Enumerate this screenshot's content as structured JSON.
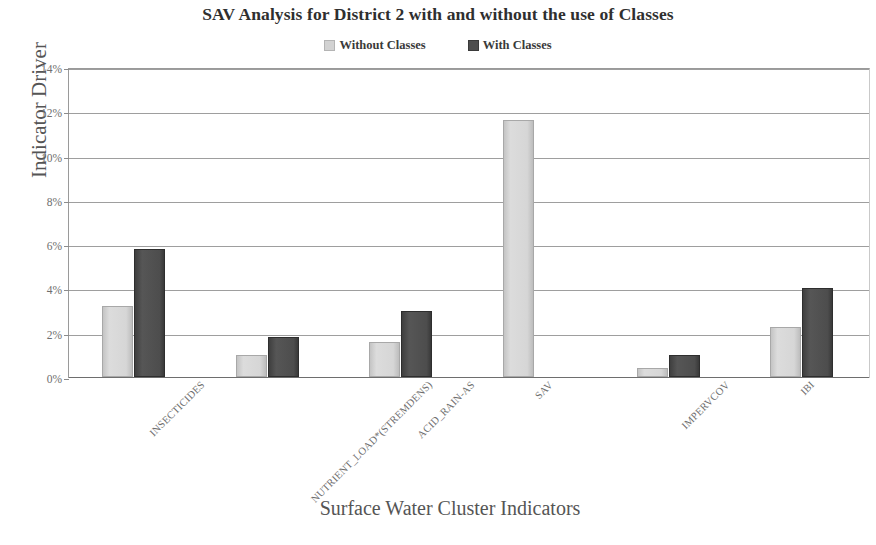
{
  "chart_data": {
    "type": "bar",
    "title": "SAV Analysis for District 2 with and without the use of Classes",
    "xlabel": "Surface Water Cluster Indicators",
    "ylabel": "Indicator Driver",
    "categories": [
      "INSECTICIDES",
      "NUTRIENT_LOAD*(STREMDENS)",
      "ACID_RAIN-AS",
      "SAV",
      "IMPERVCOV",
      "IBI"
    ],
    "series": [
      {
        "name": "Without Classes",
        "color": "#d6d6d6",
        "values": [
          3.2,
          1.0,
          1.6,
          11.6,
          0.4,
          2.25
        ]
      },
      {
        "name": "With Classes",
        "color": "#4e4e4e",
        "values": [
          5.8,
          1.8,
          3.0,
          0,
          1.0,
          4.0
        ]
      }
    ],
    "ylim": [
      0,
      14
    ],
    "ytick_labels": [
      "14%",
      "12%",
      "10%",
      "8%",
      "6%",
      "4%",
      "2%",
      "0%"
    ],
    "ytick_values": [
      14,
      12,
      10,
      8,
      6,
      4,
      2,
      0
    ],
    "grid": true,
    "legend_position": "top-center",
    "value_unit": "%"
  },
  "legend": {
    "items": [
      {
        "label": "Without Classes",
        "swatch": "light-square-icon"
      },
      {
        "label": "With Classes",
        "swatch": "dark-square-icon"
      }
    ]
  }
}
